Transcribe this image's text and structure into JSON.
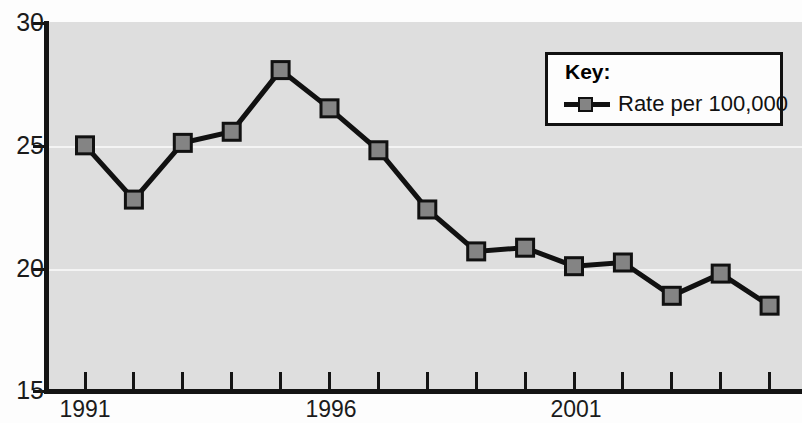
{
  "chart_data": {
    "type": "line",
    "title": "",
    "xlabel": "",
    "ylabel": "",
    "x": [
      1991,
      1992,
      1993,
      1994,
      1995,
      1996,
      1997,
      1998,
      1999,
      2000,
      2001,
      2002,
      2003,
      2004,
      2005
    ],
    "categories": [
      "1991",
      "1992",
      "1993",
      "1994",
      "1995",
      "1996",
      "1997",
      "1998",
      "1999",
      "2000",
      "2001",
      "2002",
      "2003",
      "2004",
      "2005"
    ],
    "series": [
      {
        "name": "Rate per 100,000",
        "values": [
          25.0,
          22.8,
          25.1,
          25.55,
          28.05,
          26.5,
          24.8,
          22.4,
          20.7,
          20.85,
          20.1,
          20.25,
          18.9,
          19.8,
          18.5
        ]
      }
    ],
    "ylim": [
      15,
      30
    ],
    "xlim": [
      1991,
      2005
    ],
    "y_ticks": [
      "15",
      "20",
      "25",
      "30"
    ],
    "y_tick_values": [
      15,
      20,
      25,
      30
    ],
    "x_tick_labels_shown": [
      "1991",
      "1996",
      "2001"
    ],
    "x_tick_label_values": [
      1991,
      1996,
      2001
    ],
    "grid": "horizontal-white-at-20-and-25",
    "legend_position": "top-right",
    "marker": "square",
    "colors": {
      "plot_background": "#dedede",
      "gridline": "#f4f4f4",
      "line": "#111111",
      "marker_fill": "#848484",
      "marker_border": "#111111",
      "axis": "#141414",
      "text": "#1b1b1b",
      "legend_background": "#fdfdfd",
      "legend_border": "#111111"
    }
  },
  "legend": {
    "title": "Key:",
    "entries": [
      {
        "label": "Rate per 100,000"
      }
    ]
  }
}
